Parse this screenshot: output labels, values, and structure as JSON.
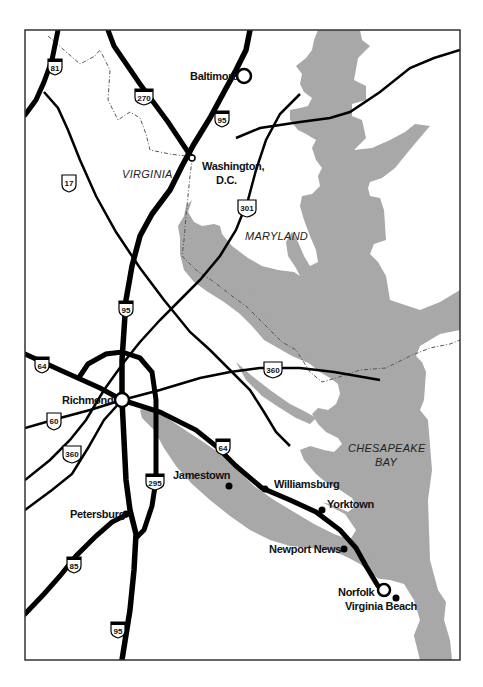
{
  "map": {
    "colors": {
      "water": "#a8a8a8",
      "land": "#ffffff",
      "road": "#000000",
      "frame": "#333333",
      "border": "#555555"
    },
    "regions": {
      "virginia": "VIRGINIA",
      "maryland": "MARYLAND",
      "bay_line1": "CHESAPEAKE",
      "bay_line2": "BAY"
    },
    "cities": {
      "baltimore": "Baltimore",
      "washington_line1": "Washington,",
      "washington_line2": "D.C.",
      "richmond": "Richmond",
      "petersburg": "Petersburg",
      "jamestown": "Jamestown",
      "williamsburg": "Williamsburg",
      "yorktown": "Yorktown",
      "newport_news": "Newport News",
      "norfolk": "Norfolk",
      "virginia_beach": "Virginia Beach"
    },
    "route_shields": {
      "i81": "81",
      "i270": "270",
      "i95_north": "95",
      "us17": "17",
      "us301": "301",
      "i95_mid": "95",
      "i64_west": "64",
      "us360_east": "360",
      "us60": "60",
      "us360_west": "360",
      "i295": "295",
      "i64_east": "64",
      "i85": "85",
      "i95_south": "95"
    }
  }
}
